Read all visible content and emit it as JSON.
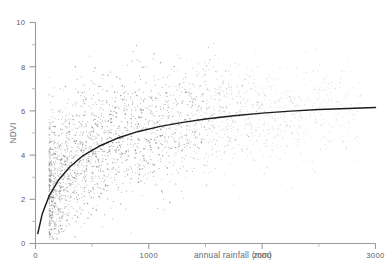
{
  "chart_data": {
    "type": "scatter",
    "title": "",
    "xlabel": "annual rainfall (mm)",
    "ylabel": "NDVI",
    "xlim": [
      0,
      3000
    ],
    "ylim": [
      0,
      10
    ],
    "grid": false,
    "legend": null,
    "x_major_ticks": [
      0,
      1000,
      2000,
      3000
    ],
    "x_minor_ticks": [
      500,
      1500,
      2500
    ],
    "y_major_ticks": [
      0,
      2,
      4,
      6,
      8,
      10
    ],
    "y_minor_ticks": [
      1,
      3,
      5,
      7,
      9
    ],
    "x_ticklabels": [
      "0",
      "1000",
      "2000",
      "3000"
    ],
    "y_ticklabels": [
      "0",
      "2",
      "4",
      "6",
      "8",
      "10"
    ],
    "marker_color": "#6f6f6f",
    "fit_color": "#1d1d1d",
    "axis_color": "#9a9a9a",
    "series": [
      {
        "name": "observations",
        "type": "scatter",
        "note": "dense cloud, peak density 300-1400 mm at NDVI 2.5-6.5, thinning above 1600 mm",
        "n_points_drawn": 2600
      },
      {
        "name": "fitted curve",
        "type": "line",
        "shape": "logarithmic / saturating",
        "x": [
          20,
          60,
          120,
          200,
          300,
          420,
          560,
          720,
          900,
          1100,
          1300,
          1500,
          1750,
          2000,
          2250,
          2500,
          2750,
          3000
        ],
        "y": [
          0.45,
          1.35,
          2.15,
          2.85,
          3.45,
          3.98,
          4.4,
          4.76,
          5.06,
          5.3,
          5.48,
          5.63,
          5.78,
          5.9,
          5.99,
          6.06,
          6.11,
          6.15
        ]
      }
    ]
  },
  "figure": {
    "background": "#ffffff",
    "width": 391,
    "height": 274
  }
}
